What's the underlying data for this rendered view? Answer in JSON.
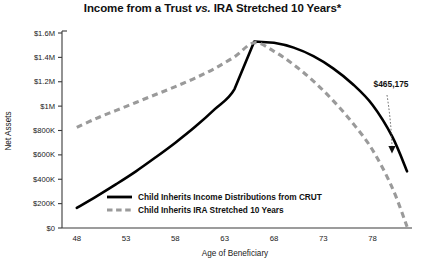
{
  "chart_data": {
    "type": "line",
    "title": "Income from a Trust vs. IRA Stretched 10 Years*",
    "title_parts": {
      "before": "Income from a Trust ",
      "italic": "vs.",
      "after": " IRA Stretched 10 Years*"
    },
    "xlabel": "Age of Beneficiary",
    "ylabel": "Net Assets",
    "xlim": [
      46.5,
      82
    ],
    "ylim": [
      0,
      1600000
    ],
    "grid": false,
    "legend_position": "inside-bottom-center",
    "xticks": [
      48,
      53,
      58,
      63,
      68,
      73,
      78
    ],
    "xtick_labels": [
      "48",
      "53",
      "58",
      "63",
      "68",
      "73",
      "78"
    ],
    "yticks": [
      0,
      200000,
      400000,
      600000,
      800000,
      1000000,
      1200000,
      1400000,
      1600000
    ],
    "ytick_labels": [
      "$0",
      "$200K",
      "$400K",
      "$600K",
      "$800K",
      "$1M",
      "$1.2M",
      "$1.4M",
      "$1.6M"
    ],
    "series": [
      {
        "name": "Child Inherits Income Distributions from CRUT",
        "style": "solid",
        "color": "#000000",
        "x": [
          48,
          50,
          52,
          54,
          56,
          58,
          60,
          62,
          64,
          66,
          68,
          70,
          72,
          74,
          76,
          78,
          80,
          81.5
        ],
        "values": [
          165000,
          260000,
          360000,
          465000,
          580000,
          700000,
          830000,
          975000,
          1140000,
          1530000,
          1520000,
          1480000,
          1410000,
          1310000,
          1180000,
          1010000,
          750000,
          465175
        ]
      },
      {
        "name": "Child Inherits IRA Stretched 10 Years",
        "style": "dashed",
        "color": "#9a9a9a",
        "x": [
          48,
          50,
          52,
          54,
          56,
          58,
          60,
          62,
          64,
          66,
          68,
          70,
          72,
          74,
          76,
          78,
          80,
          81.5
        ],
        "values": [
          825000,
          900000,
          965000,
          1030000,
          1095000,
          1160000,
          1230000,
          1310000,
          1405000,
          1520000,
          1450000,
          1340000,
          1205000,
          1045000,
          860000,
          640000,
          330000,
          10000
        ]
      }
    ],
    "annotations": [
      {
        "label": "$465,175",
        "value": 465175,
        "at_x": 81.5,
        "at_y": 465175
      }
    ]
  }
}
